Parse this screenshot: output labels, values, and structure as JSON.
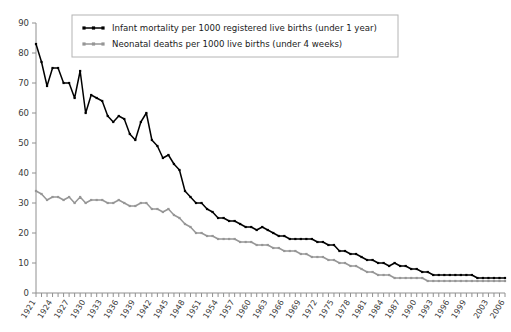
{
  "chart_data": {
    "type": "line",
    "title": "",
    "xlabel": "",
    "ylabel": "",
    "ylim": [
      0,
      90
    ],
    "ytick_step": 10,
    "grid": false,
    "legend_position": "top-center",
    "xlim": [
      1921,
      2006
    ],
    "x_tick_labels": [
      "1921",
      "1924",
      "1927",
      "1930",
      "1933",
      "1936",
      "1939",
      "1942",
      "1945",
      "1948",
      "1951",
      "1954",
      "1957",
      "1960",
      "1963",
      "1966",
      "1969",
      "1972",
      "1975",
      "1978",
      "1981",
      "1984",
      "1987",
      "1990",
      "1993",
      "1996",
      "1999",
      "2003",
      "2006"
    ],
    "y_tick_labels": [
      "0",
      "10",
      "20",
      "30",
      "40",
      "50",
      "60",
      "70",
      "80",
      "90"
    ],
    "x": [
      1921,
      1922,
      1923,
      1924,
      1925,
      1926,
      1927,
      1928,
      1929,
      1930,
      1931,
      1932,
      1933,
      1934,
      1935,
      1936,
      1937,
      1938,
      1939,
      1940,
      1941,
      1942,
      1943,
      1944,
      1945,
      1946,
      1947,
      1948,
      1949,
      1950,
      1951,
      1952,
      1953,
      1954,
      1955,
      1956,
      1957,
      1958,
      1959,
      1960,
      1961,
      1962,
      1963,
      1964,
      1965,
      1966,
      1967,
      1968,
      1969,
      1970,
      1971,
      1972,
      1973,
      1974,
      1975,
      1976,
      1977,
      1978,
      1979,
      1980,
      1981,
      1982,
      1983,
      1984,
      1985,
      1986,
      1987,
      1988,
      1989,
      1990,
      1991,
      1992,
      1993,
      1994,
      1995,
      1996,
      1997,
      1998,
      1999,
      2000,
      2001,
      2002,
      2003,
      2004,
      2005,
      2006
    ],
    "series": [
      {
        "name": "Infant mortality per 1000 registered live births (under 1 year)",
        "color": "#000000",
        "values": [
          83,
          77,
          69,
          75,
          75,
          70,
          70,
          65,
          74,
          60,
          66,
          65,
          64,
          59,
          57,
          59,
          58,
          53,
          51,
          57,
          60,
          51,
          49,
          45,
          46,
          43,
          41,
          34,
          32,
          30,
          30,
          28,
          27,
          25,
          25,
          24,
          24,
          23,
          22,
          22,
          21,
          22,
          21,
          20,
          19,
          19,
          18,
          18,
          18,
          18,
          18,
          17,
          17,
          16,
          16,
          14,
          14,
          13,
          13,
          12,
          11,
          11,
          10,
          10,
          9,
          10,
          9,
          9,
          8,
          8,
          7,
          7,
          6,
          6,
          6,
          6,
          6,
          6,
          6,
          6,
          5,
          5,
          5,
          5,
          5,
          5
        ]
      },
      {
        "name": "Neonatal deaths per 1000 live births (under 4 weeks)",
        "color": "#969696",
        "values": [
          34,
          33,
          31,
          32,
          32,
          31,
          32,
          30,
          32,
          30,
          31,
          31,
          31,
          30,
          30,
          31,
          30,
          29,
          29,
          30,
          30,
          28,
          28,
          27,
          28,
          26,
          25,
          23,
          22,
          20,
          20,
          19,
          19,
          18,
          18,
          18,
          18,
          17,
          17,
          17,
          16,
          16,
          16,
          15,
          15,
          14,
          14,
          14,
          13,
          13,
          12,
          12,
          12,
          11,
          11,
          10,
          10,
          9,
          9,
          8,
          7,
          7,
          6,
          6,
          6,
          5,
          5,
          5,
          5,
          5,
          5,
          4,
          4,
          4,
          4,
          4,
          4,
          4,
          4,
          4,
          4,
          4,
          4,
          4,
          4,
          4
        ]
      }
    ]
  },
  "legend": {
    "items": [
      {
        "label": "Infant mortality per 1000 registered live births (under 1 year)",
        "color": "#000000",
        "marker": "square"
      },
      {
        "label": "Neonatal deaths per 1000 live births (under 4 weeks)",
        "color": "#969696",
        "marker": "square"
      }
    ]
  }
}
